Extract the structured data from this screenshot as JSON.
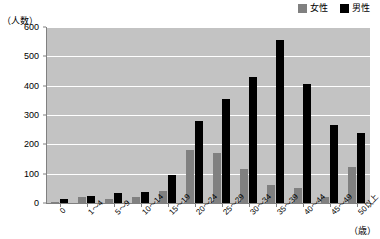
{
  "chart_data": {
    "type": "bar",
    "title": "",
    "subtitle": "",
    "xlabel": "（歳）",
    "ylabel": "（人数）",
    "ylim": [
      0,
      600
    ],
    "yticks": [
      0,
      100,
      200,
      300,
      400,
      500,
      600
    ],
    "grid": true,
    "legend_position": "top-right",
    "categories": [
      "0",
      "1〜4",
      "5〜9",
      "10〜14",
      "15〜19",
      "20〜24",
      "25〜29",
      "30〜34",
      "35〜39",
      "40〜44",
      "45〜49",
      "50以上"
    ],
    "series": [
      {
        "name": "女性",
        "color": "#808080",
        "values": [
          5,
          22,
          13,
          20,
          42,
          180,
          172,
          115,
          62,
          50,
          22,
          122
        ]
      },
      {
        "name": "男性",
        "color": "#000000",
        "values": [
          15,
          25,
          35,
          38,
          95,
          280,
          355,
          428,
          555,
          405,
          265,
          240
        ]
      }
    ]
  },
  "legend": {
    "items": [
      {
        "label": "女性",
        "color": "#808080"
      },
      {
        "label": "男性",
        "color": "#000000"
      }
    ]
  },
  "axes": {
    "y_unit_label": "（人数）",
    "x_unit_label": "（歳）",
    "y_tick_labels": [
      "600",
      "500",
      "400",
      "300",
      "200",
      "100",
      "0"
    ],
    "x_tick_labels": [
      "0",
      "1〜4",
      "5〜9",
      "10〜14",
      "15〜19",
      "20〜24",
      "25〜29",
      "30〜34",
      "35〜39",
      "40〜44",
      "45〜49",
      "50以上"
    ]
  },
  "colors": {
    "plot_background": "#c3c3c3",
    "gridline": "#ffffff",
    "axis": "#808080",
    "female": "#808080",
    "male": "#000000"
  }
}
